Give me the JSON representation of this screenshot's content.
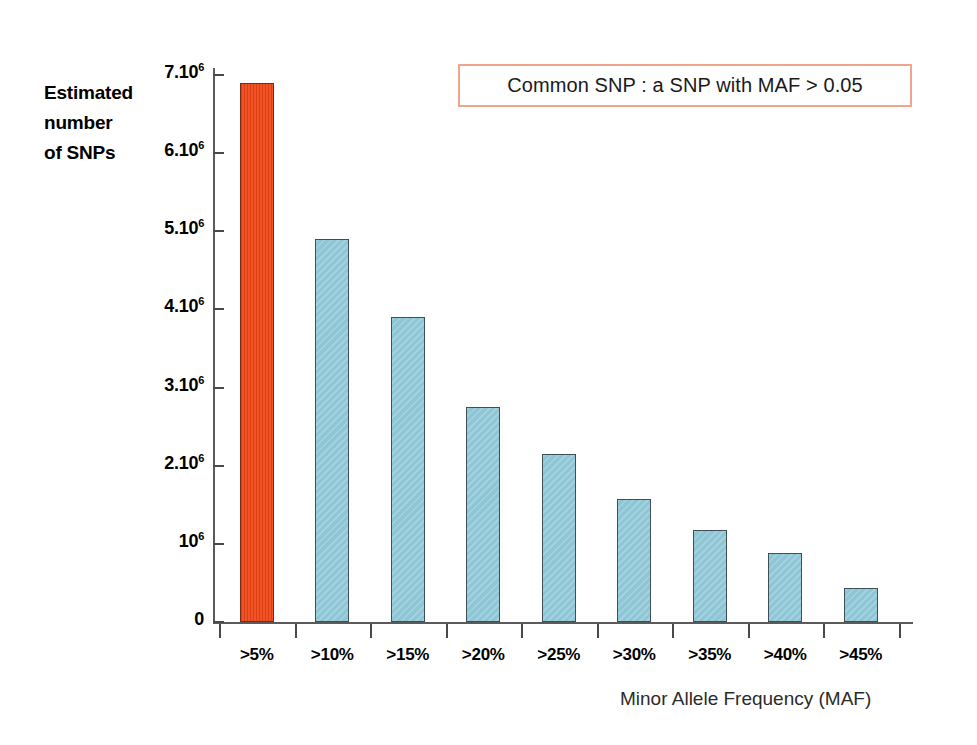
{
  "chart_data": {
    "type": "bar",
    "title": "",
    "subtitle": "",
    "xlabel": "Minor Allele Frequency (MAF)",
    "ylabel": "Estimated number of SNPs",
    "ylabel_lines": [
      "Estimated",
      "number",
      "of SNPs"
    ],
    "categories": [
      ">5%",
      ">10%",
      ">15%",
      ">20%",
      ">25%",
      ">30%",
      ">35%",
      ">40%",
      ">45%"
    ],
    "values": [
      6900000,
      4900000,
      3900000,
      2750000,
      2150000,
      1570000,
      1180000,
      880000,
      430000
    ],
    "value_labels": [
      "6.9.10⁶",
      "4.9.10⁶",
      "3.9.10⁶",
      "2.75.10⁶",
      "2.15.10⁶",
      "1.57.10⁶",
      "1.18.10⁶",
      "0.88.10⁶",
      "0.43.10⁶"
    ],
    "bar_colors": [
      "#ee4414",
      "#8ec6d6",
      "#8ec6d6",
      "#8ec6d6",
      "#8ec6d6",
      "#8ec6d6",
      "#8ec6d6",
      "#8ec6d6",
      "#8ec6d6"
    ],
    "highlight_color": "#ee4414",
    "series_color": "#8ec6d6",
    "ylim": [
      0,
      7000000
    ],
    "yticks": [
      0,
      1000000,
      2000000,
      3000000,
      4000000,
      5000000,
      6000000,
      7000000
    ],
    "ytick_labels": [
      "0",
      "10⁶",
      "2.10⁶",
      "3.10⁶",
      "4.10⁶",
      "5.10⁶",
      "6.10⁶",
      "7.10⁶"
    ],
    "ytick_labels_parts": [
      {
        "mantissa": "0",
        "exp": ""
      },
      {
        "mantissa": "10",
        "exp": "6"
      },
      {
        "mantissa": "2.10",
        "exp": "6"
      },
      {
        "mantissa": "3.10",
        "exp": "6"
      },
      {
        "mantissa": "4.10",
        "exp": "6"
      },
      {
        "mantissa": "5.10",
        "exp": "6"
      },
      {
        "mantissa": "6.10",
        "exp": "6"
      },
      {
        "mantissa": "7.10",
        "exp": "6"
      }
    ],
    "grid": false,
    "legend": false,
    "legend_position": "none"
  },
  "annotation": {
    "text": "Common SNP : a SNP with MAF > 0.05",
    "border_color": "#f0a68d"
  }
}
